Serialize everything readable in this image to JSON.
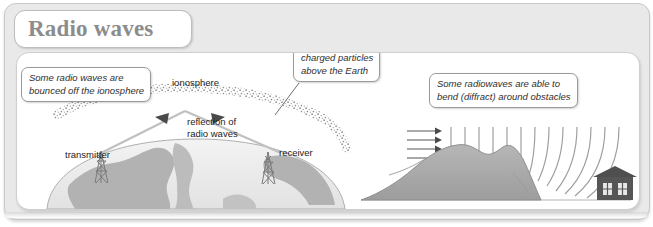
{
  "figure": {
    "title": "Radio waves"
  },
  "left_diagram": {
    "name": "ionospheric-reflection",
    "callouts": [
      {
        "id": "bounced",
        "line1": "Some radio waves are",
        "line2": "bounced off the ionosphere"
      },
      {
        "id": "charged",
        "line1": "charged particles",
        "line2": "above the Earth"
      }
    ],
    "labels": {
      "ionosphere": "ionosphere",
      "reflection_line1": "reflection of",
      "reflection_line2": "radio waves",
      "transmitter": "transmitter",
      "receiver": "receiver"
    }
  },
  "right_diagram": {
    "name": "diffraction-around-hill",
    "callouts": [
      {
        "id": "diffract",
        "line1": "Some radiowaves are able to",
        "line2": "bend (diffract) around obstacles"
      }
    ],
    "elements": {
      "incoming_arrows": 4,
      "wavefronts": 17,
      "obstacle": "hill",
      "receiver_building": "house"
    }
  },
  "colors": {
    "page_background": "#ffffff",
    "frame_background": "#e9e9e9",
    "frame_border": "#c9c9c9",
    "panel_background": "#ffffff",
    "panel_border": "#cfcfcf",
    "title_text": "#8c8c8c",
    "callout_border": "#9a9a9a",
    "earth_fill": "#eaeaea",
    "continent_fill": "#b0b0b0",
    "hill_fill": "#a8a8a8",
    "house_fill": "#5a5a5a",
    "wavefront_stroke": "#9a9a9a",
    "ray_stroke": "#bdbdbd",
    "ionosphere_dots": "#8f8f8f"
  }
}
